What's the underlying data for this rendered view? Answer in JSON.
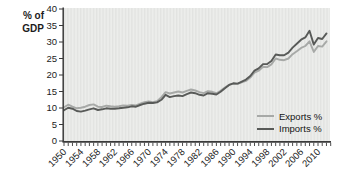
{
  "chart_data": {
    "type": "line",
    "title": "",
    "ylabel": "% of GDP",
    "ylabel_lines": [
      "% of",
      "GDP"
    ],
    "xlabel": "",
    "ylim": [
      0,
      40
    ],
    "yticks": [
      0,
      5,
      10,
      15,
      20,
      25,
      30,
      35,
      40
    ],
    "x_start": 1950,
    "x_end": 2012,
    "xtick_label_years": [
      1950,
      1954,
      1958,
      1962,
      1966,
      1970,
      1974,
      1978,
      1982,
      1986,
      1990,
      1994,
      1998,
      2002,
      2006,
      2010
    ],
    "minor_xticks_every_year": true,
    "grid": false,
    "legend_position": "bottom-right-inside",
    "axis_color": "#3a3a3a",
    "text_color": "#1c1c1c",
    "plot_bg": "#ecedeb",
    "plot_stripe": "#e2e3e1",
    "years": [
      1950,
      1951,
      1952,
      1953,
      1954,
      1955,
      1956,
      1957,
      1958,
      1959,
      1960,
      1961,
      1962,
      1963,
      1964,
      1965,
      1966,
      1967,
      1968,
      1969,
      1970,
      1971,
      1972,
      1973,
      1974,
      1975,
      1976,
      1977,
      1978,
      1979,
      1980,
      1981,
      1982,
      1983,
      1984,
      1985,
      1986,
      1987,
      1988,
      1989,
      1990,
      1991,
      1992,
      1993,
      1994,
      1995,
      1996,
      1997,
      1998,
      1999,
      2000,
      2001,
      2002,
      2003,
      2004,
      2005,
      2006,
      2007,
      2008,
      2009,
      2010,
      2011,
      2012
    ],
    "series": [
      {
        "name": "Exports %",
        "color": "#a7a9a7",
        "values": [
          10.2,
          11.0,
          10.4,
          9.9,
          10.1,
          10.4,
          10.9,
          11.1,
          10.4,
          10.3,
          10.7,
          10.5,
          10.4,
          10.5,
          10.8,
          10.7,
          10.9,
          10.8,
          11.3,
          11.8,
          12.0,
          11.8,
          12.1,
          13.3,
          14.8,
          14.4,
          14.7,
          15.0,
          14.7,
          15.2,
          15.6,
          15.3,
          14.8,
          14.5,
          15.1,
          14.9,
          14.5,
          15.2,
          16.2,
          17.0,
          17.4,
          17.3,
          17.8,
          18.2,
          19.2,
          20.7,
          21.3,
          22.5,
          22.4,
          23.2,
          25.0,
          24.6,
          24.5,
          25.0,
          26.3,
          27.2,
          28.2,
          28.8,
          30.2,
          27.0,
          28.8,
          28.6,
          30.2
        ]
      },
      {
        "name": "Imports %",
        "color": "#585a58",
        "values": [
          9.3,
          10.1,
          9.8,
          9.1,
          8.9,
          9.2,
          9.6,
          9.9,
          9.4,
          9.6,
          9.9,
          9.8,
          9.8,
          9.9,
          10.1,
          10.2,
          10.5,
          10.4,
          10.9,
          11.3,
          11.6,
          11.5,
          11.7,
          12.5,
          14.0,
          13.3,
          13.6,
          13.8,
          13.6,
          14.2,
          14.7,
          14.5,
          14.0,
          13.8,
          14.5,
          14.3,
          14.1,
          14.9,
          16.0,
          17.0,
          17.5,
          17.4,
          18.0,
          18.6,
          19.7,
          21.3,
          22.0,
          23.3,
          23.3,
          24.2,
          26.2,
          26.0,
          26.0,
          26.8,
          28.3,
          29.5,
          30.7,
          31.4,
          33.4,
          29.2,
          31.2,
          30.9,
          32.6
        ]
      }
    ]
  }
}
